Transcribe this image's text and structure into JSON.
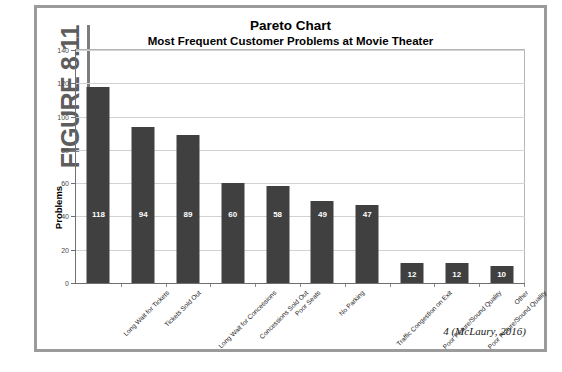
{
  "figure": {
    "label": "FIGURE 8.11",
    "citation": "4 (McLaury, 2016)"
  },
  "chart_data": {
    "type": "bar",
    "title": "Pareto Chart",
    "subtitle": "Most Frequent Customer Problems at Movie Theater",
    "xlabel": "",
    "ylabel": "Problems",
    "ylim": [
      0,
      140
    ],
    "yticks": [
      0,
      20,
      40,
      60,
      80,
      100,
      120,
      140
    ],
    "grid": true,
    "legend": "none",
    "bar_color": "#404040",
    "value_label_color": "#FFFFFF",
    "categories": [
      "Long Wait for Tickets",
      "Tickets Sold Out",
      "Long Wait for Concessions",
      "Concessions Sold Out",
      "Poor Seats",
      "No Parking",
      "Traffic Congestion on Exit",
      "Poor Picture/Sound Quality",
      "Poor Picture/Sound Quality",
      "Other"
    ],
    "values": [
      118,
      94,
      89,
      60,
      58,
      49,
      47,
      12,
      12,
      10
    ]
  }
}
